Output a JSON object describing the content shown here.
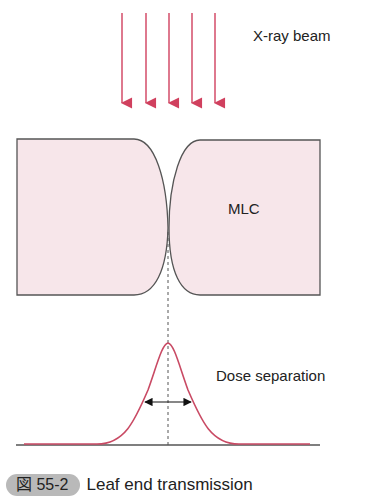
{
  "figure": {
    "beam_label": "X-ray beam",
    "mlc_label": "MLC",
    "dose_label": "Dose separation",
    "badge": "図 55-2",
    "title": "Leaf end transmission"
  },
  "colors": {
    "arrow": "#d0405e",
    "leaf_fill": "#f7e6ea",
    "leaf_stroke": "#555555",
    "curve": "#c94a64",
    "badge_bg": "#b9b9b9"
  },
  "beam_arrows": {
    "count": 5,
    "x_positions": [
      122,
      146,
      169,
      192,
      215
    ],
    "y_start": 13,
    "y_end": 105
  }
}
